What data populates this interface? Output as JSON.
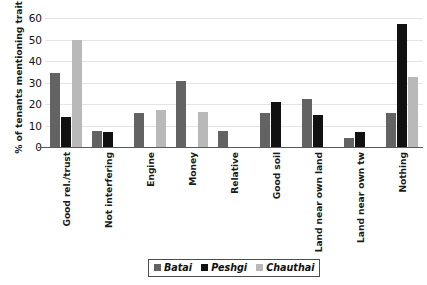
{
  "chart_data": {
    "type": "bar",
    "title": "",
    "xlabel": "",
    "ylabel": "% of tenants mentioning trait",
    "ylim": [
      0,
      60
    ],
    "yticks": [
      0,
      10,
      20,
      30,
      40,
      50,
      60
    ],
    "grid": true,
    "legend_position": "bottom",
    "categories": [
      "Good rel./trust",
      "Not interfering",
      "Engine",
      "Money",
      "Relative",
      "Good soil",
      "Land near own land",
      "Land near own tw",
      "Nothing"
    ],
    "series": [
      {
        "name": "Batai",
        "color": "#636363",
        "values": [
          34.5,
          7.5,
          16.0,
          30.5,
          7.5,
          16.0,
          22.5,
          4.0,
          16.0
        ]
      },
      {
        "name": "Peshgi",
        "color": "#111111",
        "values": [
          14.0,
          7.0,
          0,
          0,
          0,
          21.0,
          15.0,
          7.0,
          57.0
        ]
      },
      {
        "name": "Chauthai",
        "color": "#b9b9b9",
        "values": [
          50.0,
          0,
          17.0,
          16.5,
          0,
          0,
          0,
          0,
          32.5
        ]
      }
    ]
  },
  "legend": {
    "items": [
      {
        "label": "Batai"
      },
      {
        "label": "Peshgi"
      },
      {
        "label": "Chauthai"
      }
    ]
  }
}
